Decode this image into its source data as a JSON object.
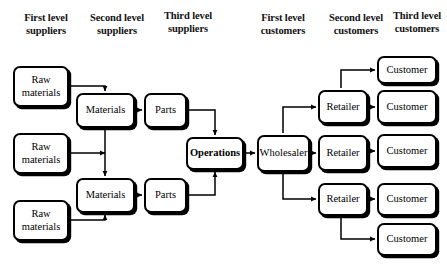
{
  "diagram": {
    "width": 447,
    "height": 276,
    "line_color": "#000000",
    "box_fill": "#ffffff",
    "box_border": "#000000"
  },
  "headers": [
    {
      "id": "first-level-suppliers",
      "line1": "First level",
      "line2": "suppliers",
      "x": 10,
      "y": 12,
      "w": 72
    },
    {
      "id": "second-level-suppliers",
      "line1": "Second level",
      "line2": "suppliers",
      "x": 78,
      "y": 12,
      "w": 78
    },
    {
      "id": "third-level-suppliers",
      "line1": "Third level",
      "line2": "suppliers",
      "x": 152,
      "y": 10,
      "w": 72
    },
    {
      "id": "first-level-customers",
      "line1": "First level",
      "line2": "customers",
      "x": 245,
      "y": 12,
      "w": 76
    },
    {
      "id": "second-level-customers",
      "line1": "Second level",
      "line2": "customers",
      "x": 316,
      "y": 12,
      "w": 80
    },
    {
      "id": "third-level-customers",
      "line1": "Third level",
      "line2": "customers",
      "x": 386,
      "y": 10,
      "w": 62
    }
  ],
  "nodes": [
    {
      "id": "raw-materials-1",
      "label": "Raw materials",
      "bold": false,
      "x": 13,
      "y": 66,
      "w": 56,
      "h": 41
    },
    {
      "id": "raw-materials-2",
      "label": "Raw materials",
      "bold": false,
      "x": 13,
      "y": 133,
      "w": 56,
      "h": 41
    },
    {
      "id": "raw-materials-3",
      "label": "Raw materials",
      "bold": false,
      "x": 13,
      "y": 200,
      "w": 56,
      "h": 41
    },
    {
      "id": "materials-1",
      "label": "Materials",
      "bold": false,
      "x": 76,
      "y": 93,
      "w": 59,
      "h": 35
    },
    {
      "id": "materials-2",
      "label": "Materials",
      "bold": false,
      "x": 76,
      "y": 178,
      "w": 59,
      "h": 35
    },
    {
      "id": "parts-1",
      "label": "Parts",
      "bold": false,
      "x": 144,
      "y": 93,
      "w": 43,
      "h": 35
    },
    {
      "id": "parts-2",
      "label": "Parts",
      "bold": false,
      "x": 144,
      "y": 178,
      "w": 43,
      "h": 35
    },
    {
      "id": "operations",
      "label": "Operations",
      "bold": true,
      "x": 186,
      "y": 137,
      "w": 58,
      "h": 33
    },
    {
      "id": "wholesaler",
      "label": "Wholesaler",
      "bold": false,
      "x": 257,
      "y": 135,
      "w": 53,
      "h": 37
    },
    {
      "id": "retailer-1",
      "label": "Retailer",
      "bold": false,
      "x": 318,
      "y": 90,
      "w": 50,
      "h": 34
    },
    {
      "id": "retailer-2",
      "label": "Retailer",
      "bold": false,
      "x": 318,
      "y": 135,
      "w": 50,
      "h": 36
    },
    {
      "id": "retailer-3",
      "label": "Retailer",
      "bold": false,
      "x": 318,
      "y": 183,
      "w": 50,
      "h": 33
    },
    {
      "id": "customer-1",
      "label": "Customer",
      "bold": false,
      "x": 377,
      "y": 56,
      "w": 60,
      "h": 28
    },
    {
      "id": "customer-2",
      "label": "Customer",
      "bold": false,
      "x": 377,
      "y": 90,
      "w": 60,
      "h": 34
    },
    {
      "id": "customer-3",
      "label": "Customer",
      "bold": false,
      "x": 377,
      "y": 134,
      "w": 60,
      "h": 34
    },
    {
      "id": "customer-4",
      "label": "Customer",
      "bold": false,
      "x": 377,
      "y": 183,
      "w": 60,
      "h": 33
    },
    {
      "id": "customer-5",
      "label": "Customer",
      "bold": false,
      "x": 377,
      "y": 223,
      "w": 60,
      "h": 33
    }
  ],
  "connections": [
    {
      "id": "raw1-to-materials1",
      "from": "raw-materials-1",
      "to": "materials-1",
      "path": "M 71 86 L 105 86 L 105 91"
    },
    {
      "id": "raw2-to-materials1",
      "from": "raw-materials-2",
      "to": "materials-1",
      "path": "M 71 153 L 105 153"
    },
    {
      "id": "materials-vertical-link",
      "from": "materials-1",
      "to": "materials-2",
      "path": "M 105 130 L 105 176",
      "double": true
    },
    {
      "id": "raw3-to-materials2",
      "from": "raw-materials-3",
      "to": "materials-2",
      "path": "M 71 220 L 105 220 L 105 215"
    },
    {
      "id": "materials1-to-parts1",
      "from": "materials-1",
      "to": "parts-1",
      "path": "M 137 110 L 142 110"
    },
    {
      "id": "materials2-to-parts2",
      "from": "materials-2",
      "to": "parts-2",
      "path": "M 137 195 L 142 195"
    },
    {
      "id": "parts1-to-operations",
      "from": "parts-1",
      "to": "operations",
      "path": "M 189 110 L 215 110 L 215 135"
    },
    {
      "id": "parts2-to-operations",
      "from": "parts-2",
      "to": "operations",
      "path": "M 189 195 L 215 195 L 215 172"
    },
    {
      "id": "operations-to-wholesaler",
      "from": "operations",
      "to": "wholesaler",
      "path": "M 246 153 L 255 153"
    },
    {
      "id": "wholesaler-to-retailer1",
      "from": "wholesaler",
      "to": "retailer-1",
      "path": "M 283 133 L 283 107 L 316 107"
    },
    {
      "id": "wholesaler-to-retailer2",
      "from": "wholesaler",
      "to": "retailer-2",
      "path": "M 312 153 L 316 153"
    },
    {
      "id": "wholesaler-to-retailer3",
      "from": "wholesaler",
      "to": "retailer-3",
      "path": "M 283 174 L 283 199 L 316 199"
    },
    {
      "id": "retailer1-to-customer1",
      "from": "retailer-1",
      "to": "customer-1",
      "path": "M 341 88 L 341 70 L 375 70"
    },
    {
      "id": "retailer1-to-customer2",
      "from": "retailer-1",
      "to": "customer-2",
      "path": "M 370 107 L 375 107"
    },
    {
      "id": "retailer2-to-customer3",
      "from": "retailer-2",
      "to": "customer-3",
      "path": "M 370 151 L 375 151"
    },
    {
      "id": "retailer3-to-customer4",
      "from": "retailer-3",
      "to": "customer-4",
      "path": "M 370 199 L 375 199"
    },
    {
      "id": "retailer3-to-customer5",
      "from": "retailer-3",
      "to": "customer-5",
      "path": "M 341 218 L 341 239 L 375 239"
    }
  ]
}
